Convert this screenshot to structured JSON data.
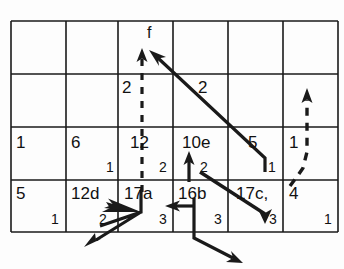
{
  "diagram": {
    "title_label": "f",
    "grid": {
      "rows": 4,
      "cols": 6,
      "x_lines": [
        11,
        66,
        118,
        173,
        228,
        283,
        338
      ],
      "y_lines": [
        21,
        74,
        127,
        180,
        232
      ],
      "stroke": "#1a1a1a"
    },
    "cells": [
      {
        "name": "r1c1",
        "main": "",
        "sub": ""
      },
      {
        "name": "r1c2",
        "main": "",
        "sub": ""
      },
      {
        "name": "r1c3",
        "main": "",
        "sub": ""
      },
      {
        "name": "r1c4",
        "main": "",
        "sub": ""
      },
      {
        "name": "r1c5",
        "main": "",
        "sub": ""
      },
      {
        "name": "r1c6",
        "main": "",
        "sub": ""
      },
      {
        "name": "r2c1",
        "main": "",
        "sub": ""
      },
      {
        "name": "r2c2",
        "main": "",
        "sub": ""
      },
      {
        "name": "r2c3",
        "main": "",
        "sub": ""
      },
      {
        "name": "r2c4",
        "main": "",
        "sub": ""
      },
      {
        "name": "r2c5",
        "main": "",
        "sub": ""
      },
      {
        "name": "r2c6",
        "main": "",
        "sub": ""
      },
      {
        "name": "r3c1",
        "main": "1",
        "sub": ""
      },
      {
        "name": "r3c2",
        "main": "6",
        "sub": "1"
      },
      {
        "name": "r3c3",
        "main": "12",
        "sub": "2"
      },
      {
        "name": "r3c4",
        "main": "10e",
        "sub": "2"
      },
      {
        "name": "r3c5",
        "main": "5",
        "sub": "1"
      },
      {
        "name": "r3c6",
        "main": "1",
        "sub": ""
      },
      {
        "name": "r4c1",
        "main": "5",
        "sub": "1"
      },
      {
        "name": "r4c2",
        "main": "12d",
        "sub": "2"
      },
      {
        "name": "r4c3",
        "main": "17a",
        "sub": "3"
      },
      {
        "name": "r4c4",
        "main": "16b",
        "sub": "3"
      },
      {
        "name": "r4c5",
        "main": "17c,",
        "sub": "3"
      },
      {
        "name": "r4c6",
        "main": "4",
        "sub": "1"
      }
    ],
    "edge_labels": [
      {
        "name": "label-dashed-vertical",
        "text": "2",
        "x": 122,
        "y": 78
      },
      {
        "name": "label-diagonal",
        "text": "2",
        "x": 198,
        "y": 78
      }
    ],
    "arrows": {
      "dashed_up_center": {
        "name": "dashed-up-arrow-center",
        "style": "dashed",
        "from": [
          142,
          192
        ],
        "to": [
          142,
          52
        ]
      },
      "dashed_up_right": {
        "name": "dashed-up-arrow-right",
        "style": "dashed",
        "from": [
          307,
          186
        ],
        "to": [
          307,
          93
        ]
      },
      "diagonal_in": {
        "name": "diagonal-incoming-arrow",
        "style": "solid",
        "from": [
          265,
          172
        ],
        "to": [
          152,
          53
        ]
      },
      "diagonal_down": {
        "name": "diagonal-down-arrow",
        "style": "solid",
        "from": [
          200,
          172
        ],
        "to": [
          265,
          222
        ]
      },
      "up_arrow_16b": {
        "name": "up-arrow-16b",
        "style": "solid",
        "from": [
          189,
          181
        ],
        "to": [
          189,
          152
        ]
      },
      "left_arrow_16b": {
        "name": "left-arrow-16b",
        "style": "solid",
        "from": [
          194,
          206
        ],
        "to": [
          166,
          206
        ]
      },
      "down_right_16b": {
        "name": "down-right-arrow-16b",
        "style": "solid",
        "from": [
          194,
          206
        ],
        "to": [
          243,
          262
        ]
      },
      "zigzag_17a": {
        "name": "zigzag-arrow-17a",
        "style": "solid",
        "points": "[[141,190],[141,212],[98,200],[141,212],[84,246]]"
      }
    },
    "colors": {
      "ink": "#1a1a1a",
      "paper": "#fdfdfd"
    }
  }
}
